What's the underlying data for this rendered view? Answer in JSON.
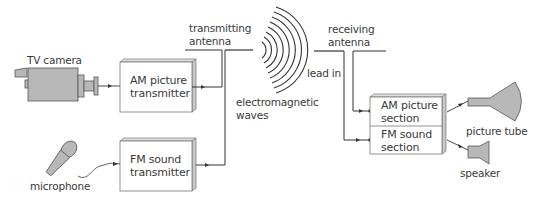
{
  "diagram": {
    "type": "block-diagram",
    "labels": {
      "tv_camera": "TV camera",
      "microphone": "microphone",
      "transmitting_antenna_line1": "transmitting",
      "transmitting_antenna_line2": "antenna",
      "electromagnetic_waves_line1": "electromagnetic",
      "electromagnetic_waves_line2": "waves",
      "receiving_antenna_line1": "receiving",
      "receiving_antenna_line2": "antenna",
      "lead_in": "lead in",
      "picture_tube": "picture tube",
      "speaker": "speaker"
    },
    "blocks": {
      "am_transmitter": {
        "line1": "AM picture",
        "line2": "transmitter"
      },
      "fm_transmitter": {
        "line1": "FM sound",
        "line2": "transmitter"
      },
      "am_section": {
        "line1": "AM picture",
        "line2": "section"
      },
      "fm_section": {
        "line1": "FM sound",
        "line2": "section"
      }
    },
    "colors": {
      "line": "#333333",
      "device_fill": "#b8b8b8",
      "box_fill": "#ffffff",
      "box_side": "#c8c8c8",
      "text": "#3a3a3a"
    }
  }
}
